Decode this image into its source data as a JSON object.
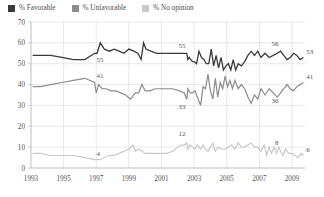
{
  "legend": {
    "position": "top-left",
    "items": [
      {
        "label": "% Favorable",
        "color": "#3a3a3a",
        "swatch": "legend-swatch-favorable"
      },
      {
        "label": "% Unfavorable",
        "color": "#8c8c8c",
        "swatch": "legend-swatch-unfavorable"
      },
      {
        "label": "% No opinion",
        "color": "#c9c9c9",
        "swatch": "legend-swatch-no-opinion"
      }
    ]
  },
  "chart_data": {
    "type": "line",
    "title": "",
    "subtitle": "",
    "xlabel": "",
    "ylabel": "",
    "xlim": [
      1993,
      2009.8
    ],
    "ylim": [
      0,
      70
    ],
    "yticks": [
      0,
      10,
      20,
      30,
      40,
      50,
      60,
      70
    ],
    "xticks": [
      1993,
      1995,
      1997,
      1999,
      2001,
      2003,
      2005,
      2007,
      2009
    ],
    "xtick_labels": [
      "1993",
      "1995",
      "1997",
      "1999",
      "2001",
      "2003",
      "2005",
      "2007",
      "2009"
    ],
    "ytick_labels": [
      "0",
      "10",
      "20",
      "30",
      "40",
      "50",
      "60",
      "70"
    ],
    "grid": true,
    "legend_position": "above-plot-left",
    "annotations": [
      {
        "text": "55",
        "x": 1996.9,
        "y": 55,
        "dx": 2,
        "dy": 9,
        "series": "% Favorable"
      },
      {
        "text": "41",
        "x": 1996.9,
        "y": 41,
        "dx": 2,
        "dy": -4,
        "series": "% Unfavorable"
      },
      {
        "text": "4",
        "x": 1996.9,
        "y": 4,
        "dx": 2,
        "dy": -4,
        "series": "% No opinion"
      },
      {
        "text": "33",
        "x": 2002.6,
        "y": 33,
        "dx": -2,
        "dy": 10,
        "series": "% Unfavorable"
      },
      {
        "text": "12",
        "x": 2002.6,
        "y": 12,
        "dx": -2,
        "dy": -7,
        "series": "% No opinion"
      },
      {
        "text": "55",
        "x": 2002.6,
        "y": 55,
        "dx": -2,
        "dy": -5,
        "series": "% Favorable"
      },
      {
        "text": "56",
        "x": 2008.3,
        "y": 56,
        "dx": -2,
        "dy": -5,
        "series": "% Favorable"
      },
      {
        "text": "36",
        "x": 2008.3,
        "y": 36,
        "dx": -2,
        "dy": 10,
        "series": "% Unfavorable"
      },
      {
        "text": "8",
        "x": 2008.3,
        "y": 8,
        "dx": -2,
        "dy": -6,
        "series": "% No opinion"
      },
      {
        "text": "53",
        "x": 2009.7,
        "y": 53,
        "dx": 3,
        "dy": -3,
        "series": "% Favorable"
      },
      {
        "text": "41",
        "x": 2009.7,
        "y": 41,
        "dx": 3,
        "dy": -3,
        "series": "% Unfavorable"
      },
      {
        "text": "6",
        "x": 2009.7,
        "y": 6,
        "dx": 3,
        "dy": -3,
        "series": "% No opinion"
      }
    ],
    "series": [
      {
        "name": "% Favorable",
        "color": "#3a3a3a",
        "width": 1.3,
        "points": [
          [
            1993.1,
            54
          ],
          [
            1993.6,
            54
          ],
          [
            1994.2,
            54
          ],
          [
            1994.9,
            53
          ],
          [
            1995.6,
            52
          ],
          [
            1996.3,
            52
          ],
          [
            1996.9,
            55
          ],
          [
            1997.05,
            55
          ],
          [
            1997.25,
            60
          ],
          [
            1997.5,
            57
          ],
          [
            1997.8,
            56
          ],
          [
            1998.1,
            57
          ],
          [
            1998.4,
            56
          ],
          [
            1998.7,
            55
          ],
          [
            1999.0,
            57
          ],
          [
            1999.3,
            56
          ],
          [
            1999.55,
            55
          ],
          [
            1999.75,
            52
          ],
          [
            1999.9,
            60
          ],
          [
            2000.05,
            57
          ],
          [
            2000.35,
            56
          ],
          [
            2000.7,
            55
          ],
          [
            2001.0,
            55
          ],
          [
            2001.4,
            55
          ],
          [
            2001.8,
            55
          ],
          [
            2002.2,
            55
          ],
          [
            2002.55,
            55
          ],
          [
            2002.62,
            52
          ],
          [
            2002.7,
            53
          ],
          [
            2002.8,
            52
          ],
          [
            2002.9,
            51
          ],
          [
            2003.0,
            51
          ],
          [
            2003.15,
            50
          ],
          [
            2003.3,
            56
          ],
          [
            2003.45,
            53
          ],
          [
            2003.6,
            52
          ],
          [
            2003.75,
            50
          ],
          [
            2003.9,
            50
          ],
          [
            2004.05,
            57
          ],
          [
            2004.2,
            49
          ],
          [
            2004.35,
            54
          ],
          [
            2004.5,
            48
          ],
          [
            2004.65,
            53
          ],
          [
            2004.8,
            47
          ],
          [
            2004.95,
            49
          ],
          [
            2005.1,
            50
          ],
          [
            2005.25,
            47
          ],
          [
            2005.4,
            52
          ],
          [
            2005.55,
            47
          ],
          [
            2005.7,
            50
          ],
          [
            2005.9,
            49
          ],
          [
            2006.1,
            51
          ],
          [
            2006.3,
            54
          ],
          [
            2006.5,
            56
          ],
          [
            2006.7,
            54
          ],
          [
            2006.9,
            56
          ],
          [
            2007.1,
            53
          ],
          [
            2007.35,
            55
          ],
          [
            2007.6,
            53
          ],
          [
            2007.85,
            54
          ],
          [
            2008.1,
            55
          ],
          [
            2008.3,
            56
          ],
          [
            2008.5,
            54
          ],
          [
            2008.7,
            52
          ],
          [
            2008.9,
            53
          ],
          [
            2009.1,
            55
          ],
          [
            2009.3,
            54
          ],
          [
            2009.5,
            52
          ],
          [
            2009.7,
            53
          ]
        ]
      },
      {
        "name": "% Unfavorable",
        "color": "#8c8c8c",
        "width": 1.2,
        "points": [
          [
            1993.1,
            39
          ],
          [
            1993.6,
            39
          ],
          [
            1994.2,
            40
          ],
          [
            1994.9,
            41
          ],
          [
            1995.6,
            42
          ],
          [
            1996.3,
            43
          ],
          [
            1996.9,
            41
          ],
          [
            1997.0,
            36
          ],
          [
            1997.15,
            40
          ],
          [
            1997.35,
            38
          ],
          [
            1997.6,
            38
          ],
          [
            1997.9,
            37
          ],
          [
            1998.2,
            37
          ],
          [
            1998.5,
            36
          ],
          [
            1998.8,
            35
          ],
          [
            1999.1,
            33
          ],
          [
            1999.4,
            36
          ],
          [
            1999.6,
            36
          ],
          [
            1999.8,
            40
          ],
          [
            2000.0,
            37
          ],
          [
            2000.3,
            37
          ],
          [
            2000.6,
            38
          ],
          [
            2000.9,
            38
          ],
          [
            2001.3,
            38
          ],
          [
            2001.7,
            38
          ],
          [
            2002.1,
            37
          ],
          [
            2002.4,
            36
          ],
          [
            2002.55,
            33
          ],
          [
            2002.62,
            38
          ],
          [
            2002.75,
            36
          ],
          [
            2002.9,
            36
          ],
          [
            2003.05,
            37
          ],
          [
            2003.2,
            34
          ],
          [
            2003.4,
            30
          ],
          [
            2003.55,
            39
          ],
          [
            2003.7,
            38
          ],
          [
            2003.85,
            45
          ],
          [
            2004.0,
            37
          ],
          [
            2004.15,
            33
          ],
          [
            2004.3,
            43
          ],
          [
            2004.45,
            34
          ],
          [
            2004.6,
            41
          ],
          [
            2004.75,
            38
          ],
          [
            2004.9,
            44
          ],
          [
            2005.05,
            39
          ],
          [
            2005.2,
            42
          ],
          [
            2005.35,
            38
          ],
          [
            2005.5,
            42
          ],
          [
            2005.7,
            38
          ],
          [
            2005.9,
            40
          ],
          [
            2006.1,
            38
          ],
          [
            2006.3,
            34
          ],
          [
            2006.5,
            31
          ],
          [
            2006.7,
            35
          ],
          [
            2006.9,
            33
          ],
          [
            2007.1,
            38
          ],
          [
            2007.35,
            35
          ],
          [
            2007.6,
            38
          ],
          [
            2007.85,
            36
          ],
          [
            2008.1,
            34
          ],
          [
            2008.3,
            36
          ],
          [
            2008.5,
            38
          ],
          [
            2008.7,
            40
          ],
          [
            2008.9,
            38
          ],
          [
            2009.1,
            37
          ],
          [
            2009.3,
            39
          ],
          [
            2009.5,
            40
          ],
          [
            2009.7,
            41
          ]
        ]
      },
      {
        "name": "% No opinion",
        "color": "#c9c9c9",
        "width": 1.2,
        "points": [
          [
            1993.1,
            7
          ],
          [
            1993.6,
            7
          ],
          [
            1994.2,
            6
          ],
          [
            1994.9,
            6
          ],
          [
            1995.6,
            6
          ],
          [
            1996.3,
            5
          ],
          [
            1996.9,
            4
          ],
          [
            1997.05,
            4
          ],
          [
            1997.25,
            4
          ],
          [
            1997.5,
            5
          ],
          [
            1997.8,
            6
          ],
          [
            1998.1,
            6
          ],
          [
            1998.4,
            7
          ],
          [
            1998.7,
            8
          ],
          [
            1999.0,
            9
          ],
          [
            1999.25,
            11
          ],
          [
            1999.4,
            8
          ],
          [
            1999.6,
            9
          ],
          [
            1999.8,
            8
          ],
          [
            2000.0,
            7
          ],
          [
            2000.3,
            7
          ],
          [
            2000.6,
            7
          ],
          [
            2000.9,
            7
          ],
          [
            2001.3,
            7
          ],
          [
            2001.7,
            8
          ],
          [
            2002.0,
            10
          ],
          [
            2002.2,
            11
          ],
          [
            2002.4,
            11
          ],
          [
            2002.55,
            12
          ],
          [
            2002.62,
            9
          ],
          [
            2002.75,
            11
          ],
          [
            2002.9,
            10
          ],
          [
            2003.05,
            9
          ],
          [
            2003.2,
            11
          ],
          [
            2003.4,
            9
          ],
          [
            2003.55,
            11
          ],
          [
            2003.7,
            9
          ],
          [
            2003.85,
            8
          ],
          [
            2004.0,
            10
          ],
          [
            2004.15,
            12
          ],
          [
            2004.3,
            8
          ],
          [
            2004.5,
            10
          ],
          [
            2004.7,
            9
          ],
          [
            2004.9,
            9
          ],
          [
            2005.1,
            10
          ],
          [
            2005.3,
            11
          ],
          [
            2005.5,
            9
          ],
          [
            2005.7,
            12
          ],
          [
            2005.9,
            10
          ],
          [
            2006.1,
            10
          ],
          [
            2006.3,
            11
          ],
          [
            2006.5,
            12
          ],
          [
            2006.7,
            10
          ],
          [
            2006.9,
            10
          ],
          [
            2007.1,
            8
          ],
          [
            2007.3,
            11
          ],
          [
            2007.45,
            6
          ],
          [
            2007.6,
            10
          ],
          [
            2007.75,
            7
          ],
          [
            2007.9,
            10
          ],
          [
            2008.05,
            7
          ],
          [
            2008.2,
            10
          ],
          [
            2008.3,
            8
          ],
          [
            2008.45,
            6
          ],
          [
            2008.6,
            9
          ],
          [
            2008.8,
            7
          ],
          [
            2009.0,
            7
          ],
          [
            2009.2,
            6
          ],
          [
            2009.4,
            5
          ],
          [
            2009.55,
            7
          ],
          [
            2009.7,
            6
          ]
        ]
      }
    ]
  }
}
